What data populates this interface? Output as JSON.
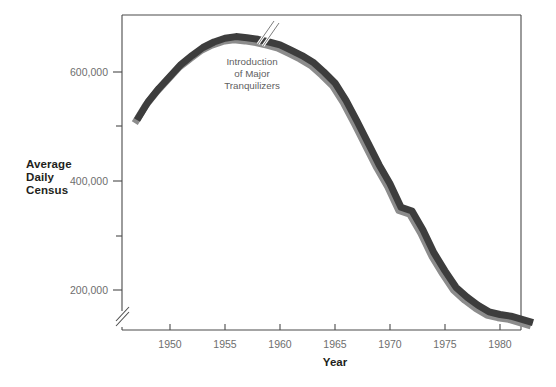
{
  "chart_data": {
    "type": "line",
    "title": "",
    "subtitle": "",
    "xlabel": "Year",
    "ylabel": "Average Daily Census",
    "ylabel_lines": [
      "Average",
      "Daily",
      "Census"
    ],
    "xlim": [
      1947,
      1983
    ],
    "ylim": [
      100000,
      680000
    ],
    "y_axis_break": true,
    "x_axis_break": false,
    "grid": false,
    "legend": "none",
    "series_color_top": "#3d3d3d",
    "series_color_shadow": "#8c8c8c",
    "frame_color": "#4a4a4a",
    "background": "#ffffff",
    "x_ticks": [
      1950,
      1955,
      1960,
      1965,
      1970,
      1975,
      1980
    ],
    "x_tick_labels": [
      "1950",
      "1955",
      "1960",
      "1965",
      "1970",
      "1975",
      "1980"
    ],
    "y_ticks_major": [
      200000,
      400000,
      600000
    ],
    "y_tick_labels": [
      "200,000",
      "400,000",
      "600,000"
    ],
    "y_ticks_minor": [
      300000,
      500000
    ],
    "annotations": [
      {
        "name": "introduction-of-major-tranquilizers",
        "lines": [
          "Introduction",
          "of  Major",
          "Tranquilizers"
        ],
        "x": 1957,
        "y": 620000,
        "marker": "slash-break"
      }
    ],
    "x": [
      1947,
      1948,
      1949,
      1950,
      1951,
      1952,
      1953,
      1954,
      1955,
      1956,
      1957,
      1958,
      1959,
      1960,
      1961,
      1962,
      1963,
      1964,
      1965,
      1966,
      1967,
      1968,
      1969,
      1970,
      1971,
      1972,
      1973,
      1974,
      1975,
      1976,
      1977,
      1978,
      1979,
      1980,
      1981,
      1982,
      1983
    ],
    "values": [
      512000,
      545000,
      570000,
      592000,
      614000,
      630000,
      645000,
      655000,
      662000,
      665000,
      663000,
      660000,
      655000,
      650000,
      640000,
      630000,
      618000,
      600000,
      580000,
      548000,
      510000,
      470000,
      430000,
      395000,
      352000,
      345000,
      310000,
      268000,
      235000,
      205000,
      187000,
      172000,
      160000,
      155000,
      152000,
      146000,
      140000
    ]
  }
}
